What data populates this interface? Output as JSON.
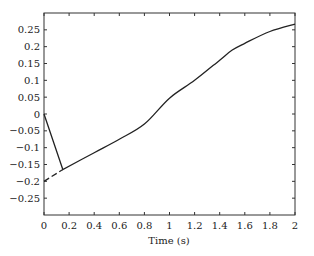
{
  "chart_data": {
    "type": "line",
    "title": "",
    "xlabel": "Time (s)",
    "ylabel": "",
    "xlim": [
      0,
      2
    ],
    "ylim": [
      -0.3,
      0.3
    ],
    "grid": false,
    "legend": null,
    "x_ticks": [
      0,
      0.2,
      0.4,
      0.6,
      0.8,
      1,
      1.2,
      1.4,
      1.6,
      1.8,
      2
    ],
    "x_tick_labels": [
      "0",
      "0.2",
      "0.4",
      "0.6",
      "0.8",
      "1",
      "1.2",
      "1.4",
      "1.6",
      "1.8",
      "2"
    ],
    "y_ticks": [
      0.25,
      0.2,
      0.15,
      0.1,
      0.05,
      0,
      -0.05,
      -0.1,
      -0.15,
      -0.2,
      -0.25
    ],
    "y_tick_labels": [
      "0.25",
      "0.2",
      "0.15",
      "0.1",
      "0.05",
      "0",
      "−0.05",
      "−0.1",
      "−0.15",
      "−0.2",
      "−0.25"
    ],
    "series": [
      {
        "name": "solid",
        "style": "solid",
        "color": "#222222",
        "x": [
          0,
          0.15,
          0.4,
          0.6,
          0.8,
          1.0,
          1.2,
          1.4,
          1.5,
          1.6,
          1.8,
          2.0
        ],
        "y": [
          0,
          -0.165,
          -0.115,
          -0.075,
          -0.03,
          0.047,
          0.1,
          0.16,
          0.19,
          0.21,
          0.245,
          0.267
        ]
      },
      {
        "name": "dashed",
        "style": "dashed",
        "color": "#222222",
        "x": [
          0,
          0.15
        ],
        "y": [
          -0.2,
          -0.165
        ]
      }
    ]
  },
  "plot_box": {
    "left": 44,
    "top": 13,
    "right": 295,
    "bottom": 215
  }
}
